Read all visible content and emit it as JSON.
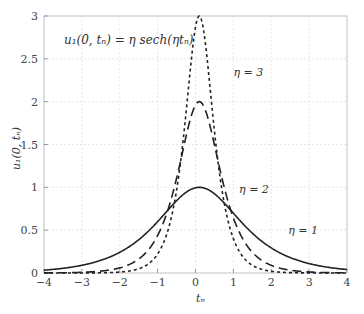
{
  "chart_data": {
    "type": "line",
    "title": "",
    "annotation": "u₁(0, tₙ) = η sech(ηtₙ)",
    "xlabel": "tₙ",
    "ylabel": "u₁(0, tₙ)",
    "xlim": [
      -4,
      4
    ],
    "ylim": [
      0,
      3
    ],
    "xticks": [
      -4,
      -3,
      -2,
      -1,
      0,
      1,
      2,
      3,
      4
    ],
    "yticks": [
      0,
      0.5,
      1,
      1.5,
      2,
      2.5,
      3
    ],
    "ytick_labels": [
      "0",
      "0.5",
      "1",
      "1.5",
      "2",
      "2.5",
      "3"
    ],
    "grid": true,
    "peak_shift": 0.1,
    "series": [
      {
        "name": "η = 1",
        "eta": 1,
        "style": "solid",
        "peak": 1.0
      },
      {
        "name": "η = 2",
        "eta": 2,
        "style": "dashed",
        "peak": 2.0
      },
      {
        "name": "η = 3",
        "eta": 3,
        "style": "dotted",
        "peak": 3.0
      }
    ],
    "labels": [
      {
        "text": "η = 3",
        "x": 1.0,
        "y": 2.3
      },
      {
        "text": "η = 2",
        "x": 1.15,
        "y": 0.93
      },
      {
        "text": "η = 1",
        "x": 2.45,
        "y": 0.45
      }
    ]
  }
}
